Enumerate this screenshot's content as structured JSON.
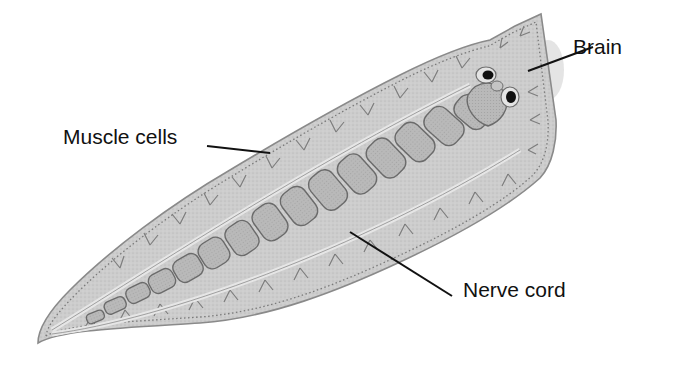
{
  "diagram": {
    "colors": {
      "background": "#ffffff",
      "body_fill": "#c9c9c9",
      "body_edge": "#8a8a8a",
      "muscle_block_fill": "#b5b5b5",
      "muscle_block_stroke": "#6e6e6e",
      "nerve_fill": "#e2e2e2",
      "eyespot": "#111111",
      "leader_line": "#111111",
      "label_text": "#111111"
    },
    "labels": [
      {
        "id": "brain",
        "text": "Brain",
        "x": 573,
        "y": 36,
        "line": [
          593,
          47,
          528,
          71
        ]
      },
      {
        "id": "muscle-cells",
        "text": "Muscle cells",
        "x": 63,
        "y": 126,
        "line": [
          207,
          146,
          270,
          153
        ]
      },
      {
        "id": "nerve-cord",
        "text": "Nerve cord",
        "x": 463,
        "y": 279,
        "line": [
          350,
          232,
          452,
          296
        ]
      }
    ]
  }
}
